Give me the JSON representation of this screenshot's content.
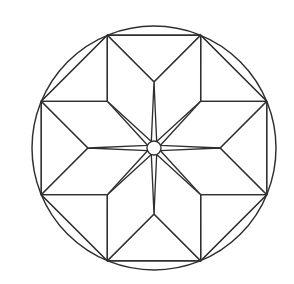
{
  "figure": {
    "title": "Eight-pointed star rosette in circle",
    "style": "black-and-white line art",
    "background_color": "#ffffff",
    "line_color": "#2f2f2f",
    "line_width_px": 1.35
  },
  "canvas": {
    "width": 294,
    "height": 284
  },
  "geometry": {
    "circle": {
      "label": "outer-circle",
      "center_x": 154,
      "center_y": 148,
      "radius": 122
    },
    "hub": {
      "label": "center-hub-circle",
      "center_x": 154,
      "center_y": 148,
      "radius": 7
    },
    "octagon": {
      "label": "inscribed-octagon",
      "sides": 8,
      "rotation_deg": 22.5,
      "circumradius": 122,
      "vertices": [
        {
          "name": "v-top-right",
          "angle_deg": -67.5,
          "x": 200.7,
          "y": 35.2
        },
        {
          "name": "v-right-top",
          "angle_deg": -22.5,
          "x": 266.7,
          "y": 101.3
        },
        {
          "name": "v-right-bottom",
          "angle_deg": 22.5,
          "x": 266.7,
          "y": 194.7
        },
        {
          "name": "v-bottom-right",
          "angle_deg": 67.5,
          "x": 200.7,
          "y": 260.8
        },
        {
          "name": "v-bottom-left",
          "angle_deg": 112.5,
          "x": 107.3,
          "y": 260.8
        },
        {
          "name": "v-left-bottom",
          "angle_deg": 157.5,
          "x": 41.3,
          "y": 194.7
        },
        {
          "name": "v-left-top",
          "angle_deg": 202.5,
          "x": 41.3,
          "y": 101.3
        },
        {
          "name": "v-top-left",
          "angle_deg": 247.5,
          "x": 107.3,
          "y": 35.2
        }
      ]
    },
    "star": {
      "label": "eight-pointed-star",
      "points": 8,
      "tip_radius": 122,
      "waist_radius": 66,
      "hub_radius": 7,
      "point_angles_deg": [
        -67.5,
        -22.5,
        22.5,
        67.5,
        112.5,
        157.5,
        202.5,
        247.5
      ],
      "tip_names": [
        "star-point-upper-right",
        "star-point-right-upper",
        "star-point-right-lower",
        "star-point-lower-right",
        "star-point-lower-left",
        "star-point-left-lower",
        "star-point-left-upper",
        "star-point-upper-left"
      ]
    },
    "fill_panels": {
      "label": "outer-trapezoid-panels",
      "count": 8,
      "names": [
        "panel-top",
        "panel-upper-right",
        "panel-right",
        "panel-lower-right",
        "panel-bottom",
        "panel-lower-left",
        "panel-left",
        "panel-upper-left"
      ]
    },
    "segments": {
      "label": "circle-edge-segments",
      "count": 8,
      "description": "circular segments between octagon chords and the outer circle"
    }
  },
  "counts": {
    "star_points": 8,
    "octagon_sides": 8,
    "outer_panels": 8,
    "total_closed_regions": 25
  }
}
